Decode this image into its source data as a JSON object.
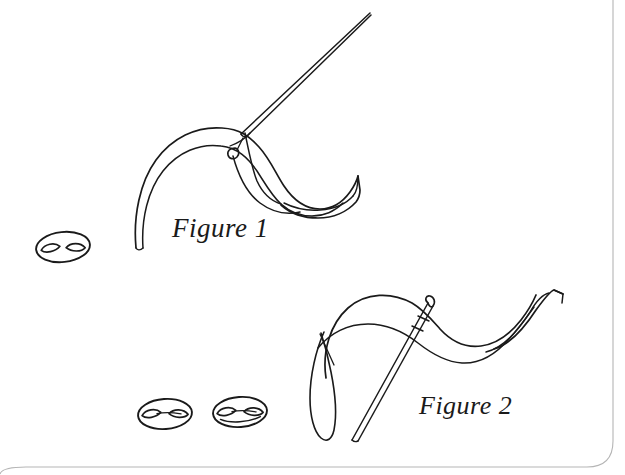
{
  "page": {
    "kind": "scanned-illustration-page",
    "background_color": "#ffffff",
    "ink_color": "#1a1a1a",
    "page_edge_color": "#b9b9b9",
    "width": 625,
    "height": 475
  },
  "figures": [
    {
      "id": "figure-1",
      "caption": "Figure 1",
      "caption_x": 172,
      "caption_y": 213,
      "subject": "needle pierced through a folded ribbon, point angled up to the right",
      "elements": [
        "sewing-needle",
        "needle-eye",
        "ribbon-band",
        "ribbon-curled-end",
        "ribbon-tapered-tail"
      ]
    },
    {
      "id": "figure-2",
      "caption": "Figure 2",
      "caption_x": 419,
      "caption_y": 391,
      "subject": "needle pushed down through a waving ribbon, point angled down to the left",
      "elements": [
        "sewing-needle",
        "needle-eye",
        "ribbon-band",
        "ribbon-hanging-loop",
        "ribbon-curled-end"
      ]
    }
  ],
  "beads": [
    {
      "id": "bead-left",
      "cx": 63,
      "cy": 247,
      "rx": 27,
      "ry": 15,
      "rotation": -6
    },
    {
      "id": "bead-bottom-1",
      "cx": 165,
      "cy": 414,
      "rx": 27,
      "ry": 15,
      "rotation": -4
    },
    {
      "id": "bead-bottom-2",
      "cx": 240,
      "cy": 412,
      "rx": 27,
      "ry": 15,
      "rotation": -4
    }
  ],
  "page_edge": {
    "right_edge_x": 613,
    "bottom_edge_y": 467,
    "corner_radius": 26
  }
}
